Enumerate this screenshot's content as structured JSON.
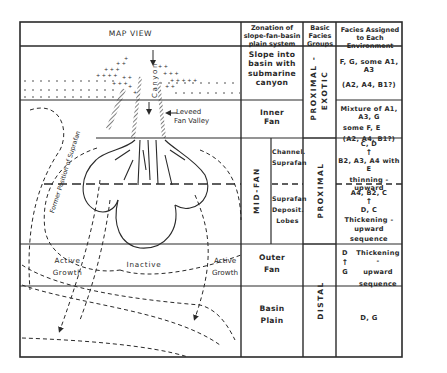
{
  "header": {
    "map_view": "MAP VIEW",
    "zonation": "Zonation of slope-fan-basin plain system",
    "groups": "Basic Facies Groups",
    "facies": "Facies Assigned to Each Environment"
  },
  "map_labels": {
    "canyon": "Canyon",
    "leveed_fan_valley_1": "Leveed",
    "leveed_fan_valley_2": "Fan Valley",
    "former_position": "Former Position of Suprafan",
    "active_left_1": "Active",
    "active_left_2": "Growth",
    "inactive": "Inactive",
    "active_right_1": "Active",
    "active_right_2": "Growth"
  },
  "zonation": {
    "slope": [
      "Slope into",
      "basin with",
      "submarine",
      "canyon"
    ],
    "inner_fan": [
      "Inner",
      "Fan"
    ],
    "mid_fan": "MID-FAN",
    "channel_suprafan": [
      "Channel.",
      "Suprafan"
    ],
    "suprafan_lobes": [
      "Suprafan",
      "Deposit.",
      "Lobes"
    ],
    "outer_fan": [
      "Outer",
      "Fan"
    ],
    "basin_plain": [
      "Basin",
      "Plain"
    ]
  },
  "groups": {
    "proximal_exotic_1": "PROXIMAL -",
    "proximal_exotic_2": "EXOTIC",
    "proximal": "PROXIMAL",
    "distal": "DISTAL"
  },
  "facies": {
    "slope_1": "F, G,  some A1, A3",
    "slope_2": "(A2, A4, B1?)",
    "inner_1": "Mixture of A1, A3, G",
    "inner_2": "some  F, E",
    "inner_3": "(A2, A4, B1?)",
    "channel_top": "C, D",
    "channel_mid": "B2, A3, A4  with E",
    "channel_bottom": "thinning - upward",
    "lobes_top": "A4, B2, C",
    "lobes_mid": "D, C",
    "lobes_bottom_1": "Thickening - upward",
    "lobes_bottom_2": "sequence",
    "outer_top_letter": "D",
    "outer_bottom_letter": "G",
    "outer_text_1": "Thickening -",
    "outer_text_2": "upward",
    "outer_text_3": "sequence",
    "basin": "D, G"
  },
  "colors": {
    "ink": "#2a2a2a",
    "paper": "#ffffff"
  }
}
